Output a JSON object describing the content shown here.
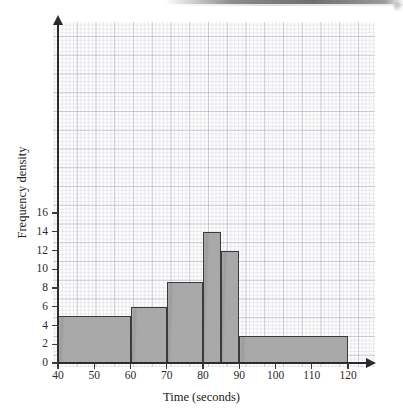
{
  "chart_data": {
    "type": "bar",
    "title": "",
    "subtitle": "",
    "xlabel": "Time (seconds)",
    "ylabel": "Frequency density",
    "xlim": [
      40,
      120
    ],
    "ylim": [
      0,
      17.5
    ],
    "grid": true,
    "legend": null,
    "x_ticks": [
      "40",
      "50",
      "60",
      "70",
      "80",
      "90",
      "100",
      "110",
      "120"
    ],
    "x_tick_values": [
      40,
      50,
      60,
      70,
      80,
      90,
      100,
      110,
      120
    ],
    "y_ticks": [
      "0",
      "2",
      "4",
      "6",
      "8",
      "10",
      "12",
      "14",
      "16"
    ],
    "y_tick_values": [
      0,
      2,
      4,
      6,
      8,
      10,
      12,
      14,
      16
    ],
    "bins": [
      {
        "label": "40-60",
        "start": 40,
        "end": 60,
        "value": 5
      },
      {
        "label": "60-70",
        "start": 60,
        "end": 70,
        "value": 6
      },
      {
        "label": "70-80",
        "start": 70,
        "end": 80,
        "value": 8.6
      },
      {
        "label": "80-85",
        "start": 80,
        "end": 85,
        "value": 14
      },
      {
        "label": "85-90",
        "start": 85,
        "end": 90,
        "value": 12
      },
      {
        "label": "90-120",
        "start": 90,
        "end": 120,
        "value": 2.9
      }
    ],
    "colors": {
      "bar_fill": "#a2a2a2",
      "bar_stroke": "#3a3a3a",
      "axis": "#2b2b2b",
      "grid_major": "#b0b0be",
      "grid_minor": "#c8c8d4",
      "paper": "#fdfdfd"
    }
  }
}
